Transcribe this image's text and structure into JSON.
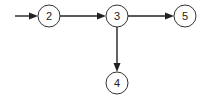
{
  "diagram": {
    "type": "directed-graph",
    "colors": {
      "stroke": "#222222",
      "node_fill": "#ffffff",
      "text": "#222222"
    },
    "nodes": [
      {
        "id": "2",
        "label": "2",
        "cx": 49,
        "cy": 16,
        "r": 11
      },
      {
        "id": "3",
        "label": "3",
        "cx": 117,
        "cy": 16,
        "r": 11
      },
      {
        "id": "5",
        "label": "5",
        "cx": 185,
        "cy": 16,
        "r": 11
      },
      {
        "id": "4",
        "label": "4",
        "cx": 117,
        "cy": 83,
        "r": 11
      }
    ],
    "edges": [
      {
        "from": "entry",
        "to": "2"
      },
      {
        "from": "2",
        "to": "3"
      },
      {
        "from": "3",
        "to": "5"
      },
      {
        "from": "3",
        "to": "4"
      }
    ]
  }
}
